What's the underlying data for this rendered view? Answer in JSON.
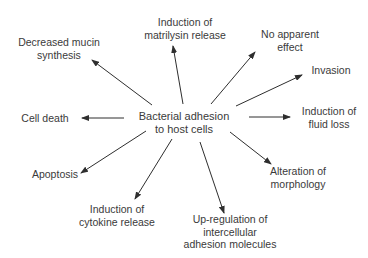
{
  "diagram": {
    "type": "radial-effects",
    "center": {
      "id": "center",
      "lines": [
        "Bacterial adhesion",
        "to host cells"
      ],
      "x": 184,
      "y": 123
    },
    "nodes": [
      {
        "id": "matrilysin",
        "lines": [
          "Induction of",
          "matrilysin release"
        ],
        "x": 185,
        "y": 28
      },
      {
        "id": "mucin",
        "lines": [
          "Decreased mucin",
          "synthesis"
        ],
        "x": 59,
        "y": 48
      },
      {
        "id": "no-effect",
        "lines": [
          "No apparent",
          "effect"
        ],
        "x": 290,
        "y": 40
      },
      {
        "id": "invasion",
        "lines": [
          "Invasion"
        ],
        "x": 331,
        "y": 70
      },
      {
        "id": "fluid-loss",
        "lines": [
          "Induction of",
          "fluid loss"
        ],
        "x": 329,
        "y": 117
      },
      {
        "id": "cell-death",
        "lines": [
          "Cell death"
        ],
        "x": 45,
        "y": 118
      },
      {
        "id": "alteration",
        "lines": [
          "Alteration of",
          "morphology"
        ],
        "x": 298,
        "y": 177
      },
      {
        "id": "apoptosis",
        "lines": [
          "Apoptosis"
        ],
        "x": 55,
        "y": 174
      },
      {
        "id": "cytokine",
        "lines": [
          "Induction of",
          "cytokine release"
        ],
        "x": 117,
        "y": 215
      },
      {
        "id": "upregulation",
        "lines": [
          "Up-regulation of",
          "intercellular",
          "adhesion molecules"
        ],
        "x": 230,
        "y": 232
      }
    ],
    "edges": [
      {
        "from": "center",
        "to": "matrilysin",
        "x1": 183,
        "y1": 104,
        "x2": 173,
        "y2": 46
      },
      {
        "from": "center",
        "to": "mucin",
        "x1": 152,
        "y1": 105,
        "x2": 92,
        "y2": 60
      },
      {
        "from": "center",
        "to": "no-effect",
        "x1": 211,
        "y1": 104,
        "x2": 255,
        "y2": 52
      },
      {
        "from": "center",
        "to": "invasion",
        "x1": 236,
        "y1": 106,
        "x2": 302,
        "y2": 75
      },
      {
        "from": "center",
        "to": "fluid-loss",
        "x1": 249,
        "y1": 117,
        "x2": 290,
        "y2": 117
      },
      {
        "from": "center",
        "to": "cell-death",
        "x1": 124,
        "y1": 118,
        "x2": 82,
        "y2": 118
      },
      {
        "from": "center",
        "to": "apoptosis",
        "x1": 146,
        "y1": 131,
        "x2": 81,
        "y2": 173
      },
      {
        "from": "center",
        "to": "cytokine",
        "x1": 172,
        "y1": 139,
        "x2": 135,
        "y2": 199
      },
      {
        "from": "center",
        "to": "upregulation",
        "x1": 200,
        "y1": 142,
        "x2": 224,
        "y2": 213
      },
      {
        "from": "center",
        "to": "alteration",
        "x1": 230,
        "y1": 132,
        "x2": 271,
        "y2": 164
      }
    ],
    "colors": {
      "background": "#ffffff",
      "text": "#3a3a3a",
      "arrow": "#2e2e2e"
    }
  }
}
